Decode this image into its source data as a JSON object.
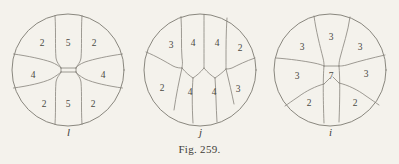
{
  "figure": {
    "caption": "Fig. 259.",
    "background_color": "#f4f2ec",
    "line_color": "#7d7a72",
    "text_color": "#3f3d38"
  },
  "panels": [
    {
      "id": "l",
      "label": "l",
      "description": "circular cell-division diagram with nine regions",
      "cells": [
        {
          "name": "top-left",
          "value": "2",
          "x": 36,
          "y": 38
        },
        {
          "name": "top-center",
          "value": "5",
          "x": 62,
          "y": 38
        },
        {
          "name": "top-right",
          "value": "2",
          "x": 88,
          "y": 38
        },
        {
          "name": "middle-left",
          "value": "4",
          "x": 27,
          "y": 70
        },
        {
          "name": "middle-center",
          "value": "",
          "x": 62,
          "y": 66
        },
        {
          "name": "middle-right",
          "value": "4",
          "x": 97,
          "y": 70
        },
        {
          "name": "bottom-left",
          "value": "2",
          "x": 38,
          "y": 99
        },
        {
          "name": "bottom-center",
          "value": "5",
          "x": 62,
          "y": 99
        },
        {
          "name": "bottom-right",
          "value": "2",
          "x": 87,
          "y": 99
        }
      ]
    },
    {
      "id": "j",
      "label": "j",
      "description": "circular cell-division diagram with eight regions",
      "cells": [
        {
          "name": "top-1",
          "value": "3",
          "x": 33,
          "y": 40
        },
        {
          "name": "top-2",
          "value": "4",
          "x": 55,
          "y": 38
        },
        {
          "name": "top-3",
          "value": "4",
          "x": 79,
          "y": 38
        },
        {
          "name": "top-4",
          "value": "2",
          "x": 102,
          "y": 43
        },
        {
          "name": "bottom-1",
          "value": "2",
          "x": 24,
          "y": 83
        },
        {
          "name": "bottom-2",
          "value": "4",
          "x": 52,
          "y": 87
        },
        {
          "name": "bottom-3",
          "value": "4",
          "x": 76,
          "y": 87
        },
        {
          "name": "bottom-4",
          "value": "3",
          "x": 100,
          "y": 84
        }
      ]
    },
    {
      "id": "i",
      "label": "i",
      "description": "circular cell-division diagram with eight regions and central cell",
      "cells": [
        {
          "name": "top-center",
          "value": "3",
          "x": 63,
          "y": 32
        },
        {
          "name": "top-left",
          "value": "3",
          "x": 34,
          "y": 42
        },
        {
          "name": "top-right",
          "value": "3",
          "x": 92,
          "y": 42
        },
        {
          "name": "middle-left",
          "value": "3",
          "x": 29,
          "y": 71
        },
        {
          "name": "center",
          "value": "7",
          "x": 63,
          "y": 71
        },
        {
          "name": "middle-right",
          "value": "3",
          "x": 98,
          "y": 69
        },
        {
          "name": "bottom-left",
          "value": "2",
          "x": 41,
          "y": 98
        },
        {
          "name": "bottom-right",
          "value": "2",
          "x": 87,
          "y": 98
        }
      ]
    }
  ]
}
